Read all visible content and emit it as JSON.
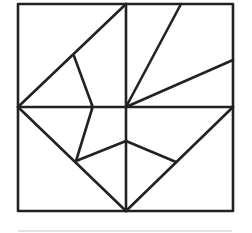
{
  "diagram": {
    "type": "geometric-dissection",
    "stroke_color": "#222222",
    "background_color": "#ffffff",
    "outer_square": {
      "x1": 18,
      "y1": 4,
      "x2": 233,
      "y2": 211
    },
    "center": {
      "x": 126,
      "y": 107
    },
    "segments": [
      {
        "name": "vertical-midline",
        "x1": 126,
        "y1": 4,
        "x2": 126,
        "y2": 211
      },
      {
        "name": "horizontal-midline",
        "x1": 18,
        "y1": 107,
        "x2": 233,
        "y2": 107
      },
      {
        "name": "upper-left-diagonal",
        "x1": 18,
        "y1": 107,
        "x2": 126,
        "y2": 4
      },
      {
        "name": "upper-left-inner-segment",
        "x1": 74,
        "y1": 56,
        "x2": 92,
        "y2": 105
      },
      {
        "name": "left-center-kink",
        "x1": 92,
        "y1": 105,
        "x2": 92,
        "y2": 109
      },
      {
        "name": "lower-left-inner-segment",
        "x1": 92,
        "y1": 109,
        "x2": 76,
        "y2": 161
      },
      {
        "name": "lower-left-to-center-segment",
        "x1": 76,
        "y1": 161,
        "x2": 126,
        "y2": 141
      },
      {
        "name": "lower-left-diagonal",
        "x1": 18,
        "y1": 107,
        "x2": 126,
        "y2": 211
      },
      {
        "name": "lower-right-diagonal",
        "x1": 126,
        "y1": 211,
        "x2": 233,
        "y2": 107
      },
      {
        "name": "upper-right-steep-ray",
        "x1": 126,
        "y1": 107,
        "x2": 181,
        "y2": 4
      },
      {
        "name": "upper-right-shallow-ray",
        "x1": 126,
        "y1": 107,
        "x2": 233,
        "y2": 60
      },
      {
        "name": "center-to-lower-right-segment",
        "x1": 126,
        "y1": 141,
        "x2": 176,
        "y2": 162
      }
    ],
    "baseline": {
      "x1": 18,
      "y1": 231,
      "x2": 232,
      "y2": 231,
      "color": "#d8d8d8"
    }
  }
}
